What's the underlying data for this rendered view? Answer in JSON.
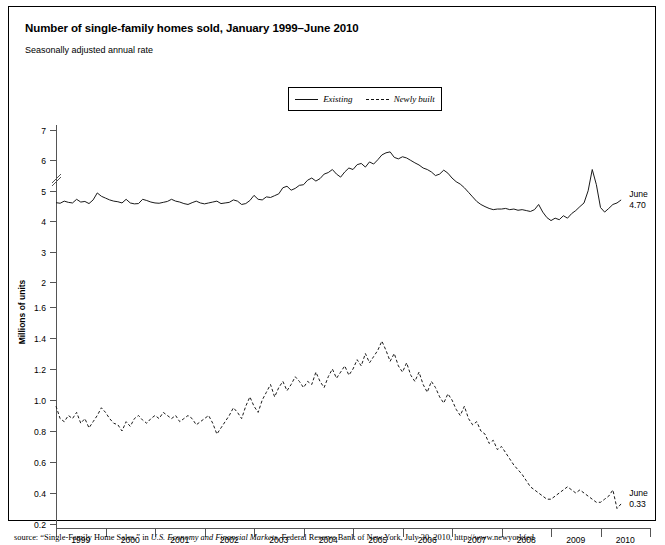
{
  "header": {
    "title": "Number of single-family homes sold, January 1999–June 2010",
    "subtitle": "Seasonally adjusted annual rate"
  },
  "legend": {
    "items": [
      {
        "label": "Existing",
        "style": "solid"
      },
      {
        "label": "Newly built",
        "style": "dashed"
      }
    ]
  },
  "annotations": {
    "existing": {
      "line1": "June",
      "line2": "4.70"
    },
    "newly_built": {
      "line1": "June",
      "line2": "0.33"
    }
  },
  "source": {
    "prefix": "source: “Single-Family Home Sales,” in ",
    "italic": "U.S. Economy and Financial Markets",
    "suffix": ", Federal Reserve Bank of New York, July 30, 2010, http://www.newyorkfed"
  },
  "chart_data": {
    "type": "line",
    "title": "Number of single-family homes sold, January 1999–June 2010",
    "subtitle": "Seasonally adjusted annual rate",
    "xlabel": "",
    "ylabel": "Millions of units",
    "grid": false,
    "legend_position": "top-center",
    "axis_break": true,
    "x_tick_labels": [
      "1999",
      "2000",
      "2001",
      "2002",
      "2003",
      "2004",
      "2005",
      "2006",
      "2007",
      "2008",
      "2009",
      "2010"
    ],
    "x_range": [
      "1999-01",
      "2010-06"
    ],
    "y_upper": {
      "ticks": [
        2,
        3,
        4,
        5,
        6,
        7
      ],
      "range": [
        2,
        7
      ],
      "applies_to": "Existing"
    },
    "y_lower": {
      "ticks": [
        0.2,
        0.4,
        0.6,
        0.8,
        1.0,
        1.2,
        1.4,
        1.6
      ],
      "range": [
        0.2,
        1.6
      ],
      "applies_to": "Newly built"
    },
    "series": [
      {
        "name": "Existing",
        "style": "solid",
        "end_label": "June 4.70",
        "values": [
          4.61,
          4.59,
          4.66,
          4.62,
          4.6,
          4.72,
          4.63,
          4.65,
          4.58,
          4.7,
          4.93,
          4.82,
          4.76,
          4.7,
          4.66,
          4.64,
          4.6,
          4.72,
          4.6,
          4.57,
          4.58,
          4.72,
          4.68,
          4.63,
          4.6,
          4.59,
          4.62,
          4.65,
          4.72,
          4.66,
          4.63,
          4.58,
          4.55,
          4.61,
          4.66,
          4.6,
          4.57,
          4.6,
          4.63,
          4.66,
          4.58,
          4.6,
          4.62,
          4.7,
          4.66,
          4.55,
          4.58,
          4.68,
          4.85,
          4.72,
          4.7,
          4.8,
          4.78,
          4.84,
          4.9,
          5.1,
          5.15,
          5.02,
          5.08,
          5.18,
          5.2,
          5.35,
          5.42,
          5.32,
          5.4,
          5.55,
          5.6,
          5.7,
          5.55,
          5.45,
          5.62,
          5.75,
          5.7,
          5.86,
          5.9,
          5.78,
          5.95,
          5.88,
          6.02,
          6.18,
          6.25,
          6.28,
          6.1,
          6.05,
          6.12,
          6.08,
          6.0,
          5.92,
          5.85,
          5.75,
          5.7,
          5.62,
          5.5,
          5.55,
          5.68,
          5.58,
          5.42,
          5.3,
          5.22,
          5.1,
          4.95,
          4.8,
          4.65,
          4.55,
          4.48,
          4.42,
          4.38,
          4.4,
          4.4,
          4.42,
          4.38,
          4.4,
          4.36,
          4.38,
          4.35,
          4.32,
          4.38,
          4.55,
          4.3,
          4.12,
          4.02,
          4.1,
          4.05,
          4.18,
          4.1,
          4.25,
          4.35,
          4.48,
          4.6,
          5.0,
          5.7,
          5.2,
          4.45,
          4.3,
          4.42,
          4.55,
          4.6,
          4.7
        ]
      },
      {
        "name": "Newly built",
        "style": "dashed",
        "end_label": "June 0.33",
        "values": [
          0.96,
          0.88,
          0.86,
          0.9,
          0.88,
          0.92,
          0.85,
          0.88,
          0.82,
          0.86,
          0.9,
          0.95,
          0.92,
          0.88,
          0.85,
          0.84,
          0.8,
          0.86,
          0.83,
          0.88,
          0.9,
          0.87,
          0.85,
          0.88,
          0.9,
          0.88,
          0.92,
          0.9,
          0.88,
          0.9,
          0.86,
          0.88,
          0.9,
          0.88,
          0.84,
          0.86,
          0.88,
          0.9,
          0.85,
          0.78,
          0.82,
          0.86,
          0.9,
          0.95,
          0.92,
          0.88,
          0.96,
          1.02,
          0.96,
          0.92,
          1.0,
          1.05,
          1.1,
          1.02,
          1.08,
          1.12,
          1.06,
          1.1,
          1.15,
          1.12,
          1.08,
          1.12,
          1.1,
          1.18,
          1.12,
          1.08,
          1.15,
          1.2,
          1.14,
          1.18,
          1.22,
          1.16,
          1.2,
          1.26,
          1.22,
          1.3,
          1.24,
          1.28,
          1.32,
          1.38,
          1.32,
          1.25,
          1.3,
          1.22,
          1.18,
          1.24,
          1.16,
          1.12,
          1.18,
          1.1,
          1.05,
          1.12,
          1.08,
          1.02,
          0.98,
          1.04,
          1.0,
          0.94,
          0.9,
          0.96,
          0.88,
          0.84,
          0.86,
          0.8,
          0.78,
          0.72,
          0.74,
          0.68,
          0.7,
          0.66,
          0.62,
          0.58,
          0.55,
          0.52,
          0.48,
          0.44,
          0.42,
          0.4,
          0.38,
          0.36,
          0.36,
          0.38,
          0.4,
          0.42,
          0.44,
          0.42,
          0.4,
          0.42,
          0.4,
          0.38,
          0.36,
          0.34,
          0.34,
          0.36,
          0.38,
          0.42,
          0.3,
          0.33
        ]
      }
    ]
  }
}
